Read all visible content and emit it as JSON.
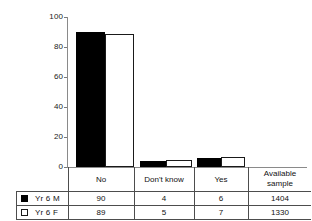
{
  "chart_data": {
    "type": "bar",
    "title": "",
    "subtitle": "",
    "xlabel": "",
    "ylabel": "",
    "ylim": [
      0,
      100
    ],
    "yticks": [
      "0",
      "20",
      "40",
      "60",
      "80",
      "100"
    ],
    "grid": false,
    "legend_position": "table-below",
    "categories": [
      "No",
      "Don't know",
      "Yes"
    ],
    "series": [
      {
        "name": "Yr 6 M",
        "values": [
          90,
          4,
          6
        ],
        "color": "#000000",
        "available_sample": 1404
      },
      {
        "name": "Yr 6 F",
        "values": [
          89,
          5,
          7
        ],
        "color": "#ffffff",
        "available_sample": 1330
      }
    ]
  },
  "axis": {
    "ticks": [
      {
        "label": "100",
        "value": 100
      },
      {
        "label": "80",
        "value": 80
      },
      {
        "label": "60",
        "value": 60
      },
      {
        "label": "40",
        "value": 40
      },
      {
        "label": "20",
        "value": 20
      },
      {
        "label": "0",
        "value": 0
      }
    ]
  },
  "table": {
    "headers": {
      "legend": "",
      "no": "No",
      "dont_know": "Don't know",
      "yes": "Yes",
      "available_line1": "Available",
      "available_line2": "sample"
    },
    "rows": [
      {
        "legend_label": "Yr 6 M",
        "swatch": "filled-square",
        "no": "90",
        "dont_know": "4",
        "yes": "6",
        "available_sample": "1404"
      },
      {
        "legend_label": "Yr 6 F",
        "swatch": "open-square",
        "no": "89",
        "dont_know": "5",
        "yes": "7",
        "available_sample": "1330"
      }
    ]
  }
}
